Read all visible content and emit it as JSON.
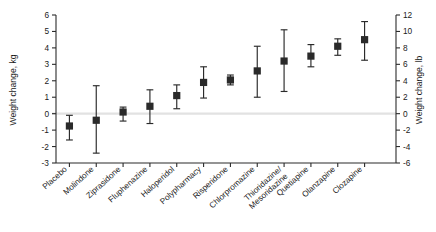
{
  "chart_data": {
    "type": "scatter",
    "title": "",
    "subtitle": "",
    "xlabel": "",
    "ylabel": "Weight change, kg",
    "ylabel_secondary": "Weight change, lb",
    "ylim": [
      -3,
      6
    ],
    "ylim_secondary": [
      -6,
      12
    ],
    "yticks": [
      -3,
      -2,
      -1,
      0,
      1,
      2,
      3,
      4,
      5,
      6
    ],
    "yticklabels": [
      "-3",
      "-2",
      "-1",
      "0",
      "1",
      "2",
      "3",
      "4",
      "5",
      "6"
    ],
    "yticks_secondary": [
      -6,
      -4,
      -2,
      0,
      2,
      4,
      6,
      8,
      10,
      12
    ],
    "yticklabels_secondary": [
      "-6",
      "-4",
      "-2",
      "0",
      "2",
      "4",
      "6",
      "8",
      "10",
      "12"
    ],
    "grid": false,
    "legend": false,
    "zero_reference_line": 0,
    "error_bar_type": "confidence-interval",
    "categories": [
      "Placebo",
      "Molindone",
      "Ziprasidone",
      "Fluphenazine",
      "Haloperidol",
      "Polypharmacy",
      "Risperidone",
      "Chlorpromazine",
      "Thioridazine/ Mesoridazine",
      "Quetiapine",
      "Olanzapine",
      "Clozapine"
    ],
    "values": [
      -0.75,
      -0.4,
      0.1,
      0.45,
      1.1,
      1.9,
      2.05,
      2.6,
      3.2,
      3.5,
      4.1,
      4.5
    ],
    "ci_low": [
      -1.6,
      -2.4,
      -0.45,
      -0.6,
      0.3,
      0.95,
      1.75,
      1.0,
      1.35,
      2.85,
      3.55,
      3.25
    ],
    "ci_high": [
      -0.1,
      1.7,
      0.4,
      1.45,
      1.75,
      2.85,
      2.35,
      4.1,
      5.1,
      4.2,
      4.55,
      5.6
    ],
    "series": [
      {
        "name": "Weight change",
        "values": [
          -0.75,
          -0.4,
          0.1,
          0.45,
          1.1,
          1.9,
          2.05,
          2.6,
          3.2,
          3.5,
          4.1,
          4.5
        ]
      }
    ]
  },
  "colors": {
    "marker": "#2a2a2a",
    "axis": "#2b2b2b",
    "zero_line": "#e2e2e2",
    "background": "#ffffff"
  }
}
